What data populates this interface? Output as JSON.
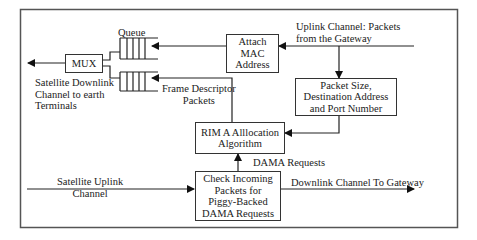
{
  "diagram": {
    "nodes": {
      "mux": {
        "label": "MUX"
      },
      "queue_label": {
        "label": "Queue"
      },
      "attach_mac": {
        "lines": [
          "Attach",
          "MAC",
          "Address"
        ]
      },
      "packet_size": {
        "lines": [
          "Packet Size,",
          "Destination Address",
          "and Port Number"
        ]
      },
      "rima": {
        "lines": [
          "RIM A Alllocation",
          "Algorithm"
        ]
      },
      "check": {
        "lines": [
          "Check Incoming",
          "Packets for",
          "Piggy-Backed",
          "DAMA Requests"
        ]
      }
    },
    "labels": {
      "uplink_gateway": [
        "Uplink Channel: Packets",
        "from the Gateway"
      ],
      "sat_downlink": [
        "Satellite Downlink",
        "Channel to earth",
        "Terminals"
      ],
      "frame_descriptor": [
        "Frame Descriptor",
        "Packets"
      ],
      "dama_requests": "DAMA Requests",
      "sat_uplink": [
        "Satellite Uplink",
        "Channel"
      ],
      "downlink_gateway": "Downlink Channel To Gateway"
    },
    "edges": [
      {
        "from": "Uplink Channel: Packets from the Gateway",
        "to": "Attach MAC Address"
      },
      {
        "from": "Uplink Channel: Packets from the Gateway",
        "to": "Packet Size, Destination Address and Port Number"
      },
      {
        "from": "Packet Size, Destination Address and Port Number",
        "to": "RIMA Allocation Algorithm"
      },
      {
        "from": "Attach MAC Address",
        "to": "Queue (data)"
      },
      {
        "from": "RIMA Allocation Algorithm",
        "to": "Queue (frame descriptor)",
        "label": "Frame Descriptor Packets"
      },
      {
        "from": "Queue",
        "to": "MUX"
      },
      {
        "from": "MUX",
        "to": "Satellite Downlink Channel to earth Terminals"
      },
      {
        "from": "Satellite Uplink Channel",
        "to": "Check Incoming Packets for Piggy-Backed DAMA Requests"
      },
      {
        "from": "Check Incoming Packets for Piggy-Backed DAMA Requests",
        "to": "RIMA Allocation Algorithm",
        "label": "DAMA Requests"
      },
      {
        "from": "Check Incoming Packets for Piggy-Backed DAMA Requests",
        "to": "Downlink Channel To Gateway"
      }
    ]
  }
}
